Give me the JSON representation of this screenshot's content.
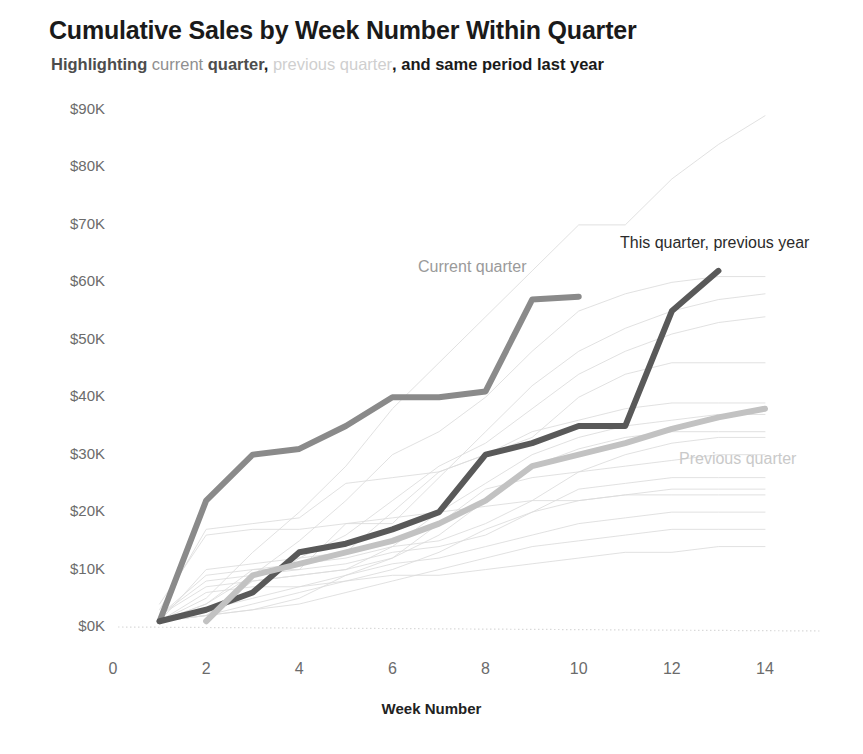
{
  "header": {
    "title": "Cumulative Sales by Week Number Within Quarter",
    "subtitle_parts": {
      "p1": "Highlighting ",
      "p2": "current",
      "p3": " quarter",
      "p4": ", ",
      "p5": "previous quarter",
      "p6": ", and same period last year"
    },
    "subtitle_full": "Highlighting current quarter, previous quarter, and same period last year"
  },
  "annotations": {
    "current_quarter": "Current quarter",
    "previous_year": "This quarter, previous year",
    "previous_quarter": "Previous quarter"
  },
  "colors": {
    "current_quarter": "#8a8a8a",
    "previous_quarter": "#c2c2c2",
    "previous_year": "#595959",
    "background_line": "#dcdcdc",
    "axis_text": "#6b6b6b",
    "title_text": "#1a1a1a"
  },
  "chart_data": {
    "type": "line",
    "title": "Cumulative Sales by Week Number Within Quarter",
    "subtitle": "Highlighting current quarter, previous quarter, and same period last year",
    "xlabel": "Week Number",
    "ylabel": "",
    "xlim": [
      0,
      14.6
    ],
    "ylim": [
      0,
      92
    ],
    "grid": false,
    "legend_position": "inline-annotations",
    "y_unit": "$K",
    "xticks": [
      0,
      2,
      4,
      6,
      8,
      10,
      12,
      14
    ],
    "xticklabels": [
      "0",
      "2",
      "4",
      "6",
      "8",
      "10",
      "12",
      "14"
    ],
    "yticks": [
      0,
      10,
      20,
      30,
      40,
      50,
      60,
      70,
      80,
      90
    ],
    "yticklabels": [
      "$0K",
      "$10K",
      "$20K",
      "$30K",
      "$40K",
      "$50K",
      "$60K",
      "$70K",
      "$80K",
      "$90K"
    ],
    "series": [
      {
        "name": "Current quarter",
        "highlight": true,
        "color": "#8a8a8a",
        "width": 6,
        "x": [
          1,
          2,
          3,
          4,
          5,
          6,
          7,
          8,
          9,
          10
        ],
        "values": [
          1,
          22,
          30,
          31,
          35,
          40,
          40,
          41,
          57,
          57.5
        ]
      },
      {
        "name": "This quarter, previous year",
        "highlight": true,
        "color": "#595959",
        "width": 6,
        "x": [
          1,
          2,
          3,
          4,
          5,
          6,
          7,
          8,
          9,
          10,
          11,
          12,
          13
        ],
        "values": [
          1,
          3,
          6,
          13,
          14.5,
          17,
          20,
          30,
          32,
          35,
          35,
          55,
          62
        ]
      },
      {
        "name": "Previous quarter",
        "highlight": true,
        "color": "#c2c2c2",
        "width": 6,
        "x": [
          2,
          3,
          4,
          5,
          6,
          7,
          8,
          9,
          10,
          11,
          12,
          13,
          14
        ],
        "values": [
          1,
          9,
          11,
          13,
          15,
          18,
          22,
          28,
          30,
          32,
          34.5,
          36.5,
          38
        ]
      },
      {
        "name": "background-1",
        "highlight": false,
        "color": "#dcdcdc",
        "width": 1,
        "x": [
          1,
          2,
          3,
          4,
          5,
          6,
          7,
          8,
          9,
          10,
          11,
          12,
          13,
          14
        ],
        "values": [
          1,
          5,
          13,
          20,
          28,
          38,
          46,
          54,
          62,
          70,
          70,
          78,
          84,
          89
        ]
      },
      {
        "name": "background-2",
        "highlight": false,
        "color": "#dcdcdc",
        "width": 1,
        "x": [
          1,
          2,
          3,
          4,
          5,
          6,
          7,
          8,
          9,
          10,
          11,
          12,
          13,
          14
        ],
        "values": [
          1,
          4,
          9,
          15,
          22,
          30,
          34,
          40,
          48,
          55,
          58,
          60,
          61,
          61
        ]
      },
      {
        "name": "background-3",
        "highlight": false,
        "color": "#dcdcdc",
        "width": 1,
        "x": [
          1,
          2,
          3,
          4,
          5,
          6,
          7,
          8,
          9,
          10,
          11,
          12,
          13,
          14
        ],
        "values": [
          2,
          8,
          9,
          10,
          18,
          18,
          26,
          34,
          42,
          48,
          52,
          55,
          57,
          58
        ]
      },
      {
        "name": "background-4",
        "highlight": false,
        "color": "#dcdcdc",
        "width": 1,
        "x": [
          1,
          2,
          3,
          4,
          5,
          6,
          7,
          8,
          9,
          10,
          11,
          12,
          13,
          14
        ],
        "values": [
          1,
          3,
          6,
          12,
          16,
          22,
          28,
          32,
          38,
          44,
          48,
          51,
          53,
          54
        ]
      },
      {
        "name": "background-5",
        "highlight": false,
        "color": "#dcdcdc",
        "width": 1,
        "x": [
          1,
          2,
          3,
          4,
          5,
          6,
          7,
          8,
          9,
          10,
          11,
          12,
          13,
          14
        ],
        "values": [
          1,
          10,
          11,
          12,
          13,
          20,
          27,
          30,
          33,
          40,
          44,
          46,
          46,
          46
        ]
      },
      {
        "name": "background-6",
        "highlight": false,
        "color": "#dcdcdc",
        "width": 1,
        "x": [
          1,
          2,
          3,
          4,
          5,
          6,
          7,
          8,
          9,
          10,
          11,
          12,
          13,
          14
        ],
        "values": [
          3,
          17,
          18,
          19,
          25,
          26,
          27,
          30,
          34,
          36,
          38,
          39,
          39,
          39
        ]
      },
      {
        "name": "background-7",
        "highlight": false,
        "color": "#dcdcdc",
        "width": 1,
        "x": [
          1,
          2,
          3,
          4,
          5,
          6,
          7,
          8,
          9,
          10,
          11,
          12,
          13,
          14
        ],
        "values": [
          1,
          2,
          8,
          9,
          10,
          14,
          20,
          25,
          30,
          33,
          35,
          36,
          37,
          37
        ]
      },
      {
        "name": "background-8",
        "highlight": false,
        "color": "#dcdcdc",
        "width": 1,
        "x": [
          1,
          2,
          3,
          4,
          5,
          6,
          7,
          8,
          9,
          10,
          11,
          12,
          13,
          14
        ],
        "values": [
          2,
          7,
          8,
          9,
          10,
          12,
          16,
          22,
          28,
          31,
          33,
          34,
          34,
          34
        ]
      },
      {
        "name": "background-9",
        "highlight": false,
        "color": "#dcdcdc",
        "width": 1,
        "x": [
          1,
          2,
          3,
          4,
          5,
          6,
          7,
          8,
          9,
          10,
          11,
          12,
          13,
          14
        ],
        "values": [
          1,
          4,
          10,
          11,
          12,
          14,
          15,
          18,
          22,
          27,
          30,
          32,
          33,
          33
        ]
      },
      {
        "name": "background-10",
        "highlight": false,
        "color": "#dcdcdc",
        "width": 1,
        "x": [
          1,
          2,
          3,
          4,
          5,
          6,
          7,
          8,
          9,
          10,
          11,
          12,
          13,
          14
        ],
        "values": [
          1,
          2,
          3,
          5,
          9,
          12,
          18,
          24,
          26,
          27,
          28,
          29,
          30,
          30
        ]
      },
      {
        "name": "background-11",
        "highlight": false,
        "color": "#dcdcdc",
        "width": 1,
        "x": [
          1,
          2,
          3,
          4,
          5,
          6,
          7,
          8,
          9,
          10,
          11,
          12,
          13,
          14
        ],
        "values": [
          2,
          9,
          10,
          10,
          11,
          13,
          14,
          16,
          20,
          24,
          25,
          26,
          26,
          26
        ]
      },
      {
        "name": "background-12",
        "highlight": false,
        "color": "#dcdcdc",
        "width": 1,
        "x": [
          1,
          2,
          3,
          4,
          5,
          6,
          7,
          8,
          9,
          10,
          11,
          12,
          13,
          14
        ],
        "values": [
          1,
          2,
          4,
          6,
          8,
          10,
          13,
          17,
          20,
          22,
          23,
          24,
          24,
          24
        ]
      },
      {
        "name": "background-13",
        "highlight": false,
        "color": "#dcdcdc",
        "width": 1,
        "x": [
          1,
          2,
          3,
          4,
          5,
          6,
          7,
          8,
          9,
          10,
          11,
          12,
          13,
          14
        ],
        "values": [
          4,
          16,
          17,
          17,
          18,
          19,
          20,
          21,
          22,
          22,
          23,
          23,
          23,
          23
        ]
      },
      {
        "name": "background-14",
        "highlight": false,
        "color": "#dcdcdc",
        "width": 1,
        "x": [
          1,
          2,
          3,
          4,
          5,
          6,
          7,
          8,
          9,
          10,
          11,
          12,
          13,
          14
        ],
        "values": [
          1,
          3,
          5,
          7,
          9,
          11,
          12,
          14,
          16,
          18,
          19,
          20,
          20,
          20
        ]
      },
      {
        "name": "background-15",
        "highlight": false,
        "color": "#dcdcdc",
        "width": 1,
        "x": [
          1,
          2,
          3,
          4,
          5,
          6,
          7,
          8,
          9,
          10,
          11,
          12,
          13,
          14
        ],
        "values": [
          1,
          2,
          3,
          4,
          6,
          8,
          10,
          12,
          14,
          15,
          16,
          17,
          17,
          17
        ]
      },
      {
        "name": "background-16",
        "highlight": false,
        "color": "#dcdcdc",
        "width": 1,
        "x": [
          1,
          2,
          3,
          4,
          5,
          6,
          7,
          8,
          9,
          10,
          11,
          12,
          13,
          14
        ],
        "values": [
          1,
          6,
          7,
          7,
          8,
          9,
          9,
          10,
          11,
          12,
          13,
          13,
          14,
          14
        ]
      }
    ]
  }
}
